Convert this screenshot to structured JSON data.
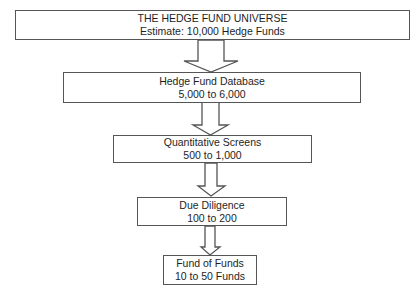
{
  "diagram": {
    "type": "funnel-flowchart",
    "direction": "top-to-bottom",
    "colors": {
      "stroke": "#555555",
      "text": "#1e1e1e",
      "fill": "#ffffff"
    },
    "stages": [
      {
        "id": "universe",
        "line1": "THE HEDGE FUND UNIVERSE",
        "line2": "Estimate: 10,000 Hedge Funds"
      },
      {
        "id": "database",
        "line1": "Hedge Fund Database",
        "line2": "5,000 to 6,000"
      },
      {
        "id": "quant",
        "line1": "Quantitative Screens",
        "line2": "500 to 1,000"
      },
      {
        "id": "diligence",
        "line1": "Due Diligence",
        "line2": "100 to 200"
      },
      {
        "id": "fof",
        "line1": "Fund of Funds",
        "line2": "10 to 50 Funds"
      }
    ],
    "edges": [
      {
        "from": "universe",
        "to": "database",
        "style": "block-arrow"
      },
      {
        "from": "database",
        "to": "quant",
        "style": "block-arrow"
      },
      {
        "from": "quant",
        "to": "diligence",
        "style": "block-arrow"
      },
      {
        "from": "diligence",
        "to": "fof",
        "style": "block-arrow"
      }
    ]
  }
}
